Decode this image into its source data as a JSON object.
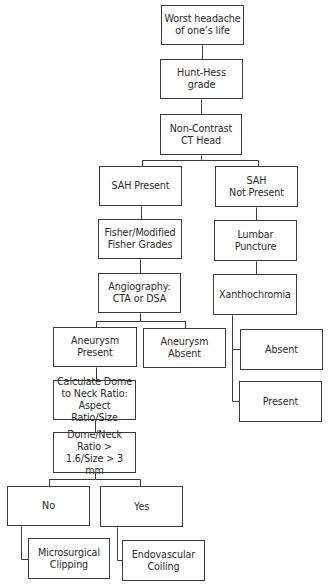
{
  "diagram": {
    "type": "flowchart",
    "colors": {
      "line": "#3a3a3a",
      "text": "#2a2a2a",
      "background": "#ffffff"
    },
    "nodes": [
      {
        "id": "worst_headache",
        "label": "Worst headache\nof one’s life",
        "x": 161,
        "y": 5,
        "w": 83,
        "h": 40
      },
      {
        "id": "hunt_hess",
        "label": "Hunt-Hess\ngrade",
        "x": 160,
        "y": 59,
        "w": 83,
        "h": 40
      },
      {
        "id": "ct_head",
        "label": "Non-Contrast\nCT Head",
        "x": 160,
        "y": 114,
        "w": 82,
        "h": 41
      },
      {
        "id": "sah_present",
        "label": "SAH Present",
        "x": 99,
        "y": 166,
        "w": 83,
        "h": 40
      },
      {
        "id": "sah_not_present",
        "label": "SAH\nNot Present",
        "x": 215,
        "y": 166,
        "w": 83,
        "h": 41
      },
      {
        "id": "fisher",
        "label": "Fisher/Modified\nFisher Grades",
        "x": 98,
        "y": 219,
        "w": 84,
        "h": 40
      },
      {
        "id": "lumbar_puncture",
        "label": "Lumbar\nPuncture",
        "x": 214,
        "y": 220,
        "w": 83,
        "h": 41
      },
      {
        "id": "angiography",
        "label": "Angiography:\nCTA or DSA",
        "x": 98,
        "y": 273,
        "w": 83,
        "h": 40
      },
      {
        "id": "xanthochromia",
        "label": "Xanthochromia",
        "x": 213,
        "y": 274,
        "w": 84,
        "h": 41
      },
      {
        "id": "aneurysm_present",
        "label": "Aneurysm\nPresent",
        "x": 53,
        "y": 327,
        "w": 84,
        "h": 40
      },
      {
        "id": "aneurysm_absent",
        "label": "Aneurysm\nAbsent",
        "x": 143,
        "y": 328,
        "w": 83,
        "h": 40
      },
      {
        "id": "xantho_absent",
        "label": "Absent",
        "x": 240,
        "y": 329,
        "w": 83,
        "h": 41
      },
      {
        "id": "xantho_present",
        "label": "Present",
        "x": 239,
        "y": 381,
        "w": 83,
        "h": 41
      },
      {
        "id": "calculate_ratio",
        "label": "Calculate Dome\nto Neck Ratio:\nAspect Ratio/Size",
        "x": 53,
        "y": 380,
        "w": 83,
        "h": 40
      },
      {
        "id": "dome_neck",
        "label": "Dome/Neck\nRatio >\n1.6/Size > 3 mm",
        "x": 53,
        "y": 432,
        "w": 83,
        "h": 41
      },
      {
        "id": "no",
        "label": "No",
        "x": 7,
        "y": 486,
        "w": 83,
        "h": 40
      },
      {
        "id": "yes",
        "label": "Yes",
        "x": 100,
        "y": 486,
        "w": 83,
        "h": 41
      },
      {
        "id": "microsurgical",
        "label": "Microsurgical\nClipping",
        "x": 28,
        "y": 538,
        "w": 82,
        "h": 41
      },
      {
        "id": "endovascular",
        "label": "Endovascular\nCoiling",
        "x": 122,
        "y": 540,
        "w": 83,
        "h": 41
      }
    ],
    "edges": [
      {
        "from": "worst_headache",
        "to": "hunt_hess"
      },
      {
        "from": "hunt_hess",
        "to": "ct_head"
      },
      {
        "from": "ct_head",
        "to": "sah_present"
      },
      {
        "from": "ct_head",
        "to": "sah_not_present"
      },
      {
        "from": "sah_present",
        "to": "fisher"
      },
      {
        "from": "fisher",
        "to": "angiography"
      },
      {
        "from": "angiography",
        "to": "aneurysm_present"
      },
      {
        "from": "angiography",
        "to": "aneurysm_absent"
      },
      {
        "from": "aneurysm_present",
        "to": "calculate_ratio"
      },
      {
        "from": "calculate_ratio",
        "to": "dome_neck"
      },
      {
        "from": "dome_neck",
        "to": "no"
      },
      {
        "from": "dome_neck",
        "to": "yes"
      },
      {
        "from": "no",
        "to": "microsurgical"
      },
      {
        "from": "yes",
        "to": "endovascular"
      },
      {
        "from": "sah_not_present",
        "to": "lumbar_puncture"
      },
      {
        "from": "lumbar_puncture",
        "to": "xanthochromia"
      },
      {
        "from": "xanthochromia",
        "to": "xantho_absent"
      },
      {
        "from": "xanthochromia",
        "to": "xantho_present"
      }
    ],
    "polylines": [
      [
        [
          202,
          45
        ],
        [
          202,
          59
        ]
      ],
      [
        [
          201,
          99
        ],
        [
          201,
          114
        ]
      ],
      [
        [
          201,
          155
        ],
        [
          201,
          160
        ],
        [
          142,
          160
        ],
        [
          142,
          166
        ]
      ],
      [
        [
          201,
          160
        ],
        [
          258,
          160
        ],
        [
          258,
          166
        ]
      ],
      [
        [
          141,
          206
        ],
        [
          141,
          219
        ]
      ],
      [
        [
          140,
          259
        ],
        [
          140,
          273
        ]
      ],
      [
        [
          140,
          313
        ],
        [
          140,
          321
        ],
        [
          96,
          321
        ],
        [
          96,
          327
        ]
      ],
      [
        [
          140,
          321
        ],
        [
          185,
          321
        ],
        [
          185,
          328
        ]
      ],
      [
        [
          96,
          367
        ],
        [
          96,
          380
        ]
      ],
      [
        [
          95,
          420
        ],
        [
          95,
          432
        ]
      ],
      [
        [
          95,
          473
        ],
        [
          95,
          479
        ],
        [
          49,
          479
        ],
        [
          49,
          486
        ]
      ],
      [
        [
          95,
          479
        ],
        [
          140,
          479
        ],
        [
          140,
          486
        ]
      ],
      [
        [
          21,
          526
        ],
        [
          21,
          559
        ],
        [
          28,
          559
        ]
      ],
      [
        [
          117,
          527
        ],
        [
          117,
          560
        ],
        [
          122,
          560
        ]
      ],
      [
        [
          256,
          207
        ],
        [
          256,
          220
        ]
      ],
      [
        [
          256,
          261
        ],
        [
          256,
          274
        ]
      ],
      [
        [
          232,
          315
        ],
        [
          232,
          401
        ],
        [
          239,
          401
        ]
      ],
      [
        [
          232,
          349
        ],
        [
          240,
          349
        ]
      ]
    ]
  }
}
